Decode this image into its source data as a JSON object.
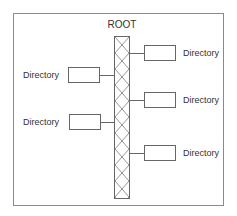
{
  "diagram": {
    "root": {
      "label": "ROOT"
    },
    "left_directories": [
      {
        "label": "Directory"
      },
      {
        "label": "Directory"
      }
    ],
    "right_directories": [
      {
        "label": "Directory"
      },
      {
        "label": "Directory"
      },
      {
        "label": "Directory"
      }
    ],
    "colors": {
      "line": "#666666",
      "frame": "#8a8a8a",
      "text": "#333333",
      "background": "#ffffff"
    }
  }
}
